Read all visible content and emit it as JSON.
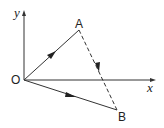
{
  "diagram": {
    "title": "",
    "axes": {
      "x_label": "x",
      "y_label": "y",
      "origin_label": "O"
    },
    "points": [
      {
        "label": "O",
        "role": "origin"
      },
      {
        "label": "A",
        "role": "point"
      },
      {
        "label": "B",
        "role": "point"
      }
    ],
    "vectors": [
      {
        "from": "O",
        "to": "A",
        "style": "solid",
        "arrow": "midpoint"
      },
      {
        "from": "O",
        "to": "B",
        "style": "solid",
        "arrow": "midpoint"
      },
      {
        "from": "A",
        "to": "B",
        "style": "dashed",
        "arrow": "midpoint"
      }
    ],
    "colors": {
      "line": "#333333",
      "background": "#ffffff"
    }
  }
}
